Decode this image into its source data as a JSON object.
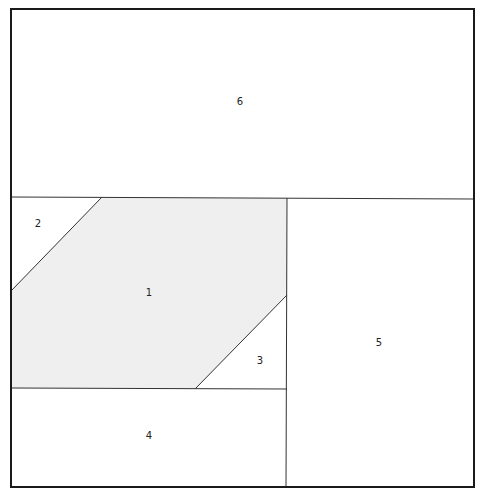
{
  "diagram": {
    "type": "partition-layout",
    "colors": {
      "stroke": "#1a1a1a",
      "inner_stroke": "#333333",
      "shaded_fill": "#efefef",
      "background": "#ffffff"
    },
    "regions": [
      {
        "id": "1",
        "label": "1",
        "shape": "parallelogram",
        "shaded": true
      },
      {
        "id": "2",
        "label": "2",
        "shape": "triangle",
        "shaded": false
      },
      {
        "id": "3",
        "label": "3",
        "shape": "triangle",
        "shaded": false
      },
      {
        "id": "4",
        "label": "4",
        "shape": "rectangle",
        "shaded": false
      },
      {
        "id": "5",
        "label": "5",
        "shape": "rectangle",
        "shaded": false
      },
      {
        "id": "6",
        "label": "6",
        "shape": "rectangle",
        "shaded": false
      }
    ]
  }
}
